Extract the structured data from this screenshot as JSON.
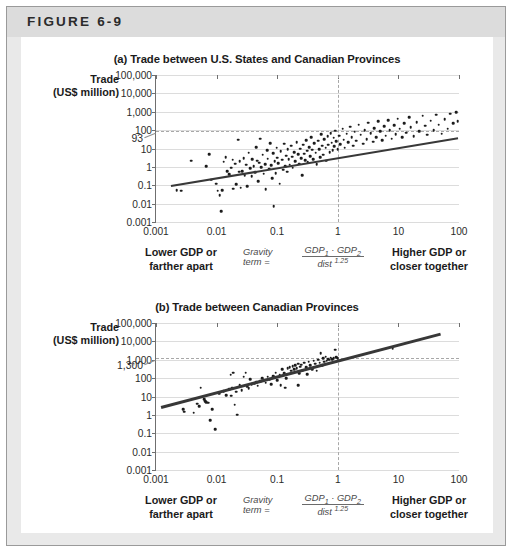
{
  "figure": {
    "label": "FIGURE 6-9"
  },
  "panels": [
    {
      "id": "a",
      "title": "(a) Trade between U.S. States and Canadian Provinces",
      "ylabel_line1": "Trade",
      "ylabel_line2": "(US$ million)",
      "annotation": "93",
      "caption_left_line1": "Lower GDP or",
      "caption_left_line2": "farther apart",
      "caption_right_line1": "Higher GDP or",
      "caption_right_line2": "closer together",
      "gravity_label": "Gravity term =",
      "gravity_num_a": "GDP",
      "gravity_num_sub_a": "1",
      "gravity_dot": "·",
      "gravity_num_b": "GDP",
      "gravity_num_sub_b": "2",
      "gravity_den": "dist",
      "gravity_den_sup": "1.25"
    },
    {
      "id": "b",
      "title": "(b) Trade between Canadian Provinces",
      "ylabel_line1": "Trade",
      "ylabel_line2": "(US$ million)",
      "annotation": "1,300",
      "caption_left_line1": "Lower GDP or",
      "caption_left_line2": "farther apart",
      "caption_right_line1": "Higher GDP or",
      "caption_right_line2": "closer together",
      "gravity_label": "Gravity term =",
      "gravity_num_a": "GDP",
      "gravity_num_sub_a": "1",
      "gravity_dot": "·",
      "gravity_num_b": "GDP",
      "gravity_num_sub_b": "2",
      "gravity_den": "dist",
      "gravity_den_sup": "1.25"
    }
  ],
  "chart_data": [
    {
      "type": "scatter",
      "panel": "a",
      "title": "(a) Trade between U.S. States and Canadian Provinces",
      "xlabel": "Gravity term = GDP1 · GDP2 / dist^1.25",
      "ylabel": "Trade (US$ million)",
      "xscale": "log",
      "yscale": "log",
      "xlim": [
        0.001,
        100
      ],
      "ylim": [
        0.001,
        100000
      ],
      "xticks": [
        "0.001",
        "0.01",
        "0.1",
        "1",
        "10",
        "100"
      ],
      "yticks": [
        "0.001",
        "0.01",
        "0.1",
        "1",
        "10",
        "100",
        "1,000",
        "10,000",
        "100,000"
      ],
      "grid": true,
      "reference_lines": {
        "horizontal_y": 93,
        "horizontal_label": "93",
        "vertical_x": 1
      },
      "trendline": {
        "x": [
          0.0018,
          100
        ],
        "y": [
          0.1,
          40
        ]
      },
      "points": [
        [
          0.0022,
          0.055
        ],
        [
          0.0026,
          0.05
        ],
        [
          0.0038,
          2.2
        ],
        [
          0.0068,
          1.1
        ],
        [
          0.0075,
          5.0
        ],
        [
          0.0082,
          0.2
        ],
        [
          0.0098,
          0.12
        ],
        [
          0.0105,
          0.05
        ],
        [
          0.0112,
          0.028
        ],
        [
          0.0118,
          0.004
        ],
        [
          0.0125,
          0.055
        ],
        [
          0.013,
          1.9
        ],
        [
          0.0142,
          3.4
        ],
        [
          0.015,
          0.6
        ],
        [
          0.0162,
          0.4
        ],
        [
          0.0175,
          0.9
        ],
        [
          0.0185,
          2.5
        ],
        [
          0.019,
          0.065
        ],
        [
          0.0205,
          1.5
        ],
        [
          0.021,
          0.11
        ],
        [
          0.0225,
          30
        ],
        [
          0.0235,
          0.55
        ],
        [
          0.024,
          2.0
        ],
        [
          0.025,
          0.075
        ],
        [
          0.0265,
          0.6
        ],
        [
          0.028,
          3.0
        ],
        [
          0.029,
          0.36
        ],
        [
          0.031,
          1.3
        ],
        [
          0.032,
          0.09
        ],
        [
          0.034,
          6.0
        ],
        [
          0.036,
          0.85
        ],
        [
          0.038,
          0.3
        ],
        [
          0.039,
          2.6
        ],
        [
          0.041,
          1.05
        ],
        [
          0.043,
          0.5
        ],
        [
          0.045,
          12
        ],
        [
          0.047,
          2.2
        ],
        [
          0.049,
          0.17
        ],
        [
          0.051,
          1.7
        ],
        [
          0.053,
          35
        ],
        [
          0.055,
          0.95
        ],
        [
          0.058,
          4.5
        ],
        [
          0.06,
          0.42
        ],
        [
          0.063,
          1.4
        ],
        [
          0.065,
          0.06
        ],
        [
          0.068,
          8.0
        ],
        [
          0.07,
          2.8
        ],
        [
          0.073,
          0.8
        ],
        [
          0.076,
          20
        ],
        [
          0.079,
          1.2
        ],
        [
          0.082,
          0.25
        ],
        [
          0.085,
          5.5
        ],
        [
          0.088,
          0.007
        ],
        [
          0.091,
          2.1
        ],
        [
          0.095,
          0.45
        ],
        [
          0.098,
          11
        ],
        [
          0.1,
          3.2
        ],
        [
          0.105,
          1.6
        ],
        [
          0.11,
          0.12
        ],
        [
          0.115,
          7.0
        ],
        [
          0.12,
          2.4
        ],
        [
          0.125,
          0.7
        ],
        [
          0.13,
          18
        ],
        [
          0.135,
          1.1
        ],
        [
          0.14,
          4.0
        ],
        [
          0.145,
          0.55
        ],
        [
          0.15,
          9.0
        ],
        [
          0.155,
          2.7
        ],
        [
          0.16,
          1.3
        ],
        [
          0.17,
          14
        ],
        [
          0.175,
          3.6
        ],
        [
          0.18,
          0.9
        ],
        [
          0.19,
          6.5
        ],
        [
          0.2,
          2.0
        ],
        [
          0.21,
          22
        ],
        [
          0.22,
          4.8
        ],
        [
          0.23,
          1.5
        ],
        [
          0.24,
          10
        ],
        [
          0.25,
          3.0
        ],
        [
          0.26,
          0.35
        ],
        [
          0.27,
          16
        ],
        [
          0.28,
          5.2
        ],
        [
          0.29,
          2.3
        ],
        [
          0.3,
          28
        ],
        [
          0.31,
          7.5
        ],
        [
          0.32,
          1.8
        ],
        [
          0.34,
          12
        ],
        [
          0.35,
          3.8
        ],
        [
          0.36,
          40
        ],
        [
          0.38,
          8.5
        ],
        [
          0.39,
          2.6
        ],
        [
          0.41,
          19
        ],
        [
          0.43,
          5.8
        ],
        [
          0.45,
          1.4
        ],
        [
          0.47,
          26
        ],
        [
          0.49,
          9.5
        ],
        [
          0.51,
          3.4
        ],
        [
          0.53,
          60
        ],
        [
          0.55,
          14
        ],
        [
          0.58,
          4.6
        ],
        [
          0.6,
          32
        ],
        [
          0.63,
          11
        ],
        [
          0.65,
          2.2
        ],
        [
          0.68,
          45
        ],
        [
          0.7,
          16
        ],
        [
          0.73,
          6.2
        ],
        [
          0.76,
          70
        ],
        [
          0.79,
          21
        ],
        [
          0.82,
          8.0
        ],
        [
          0.85,
          38
        ],
        [
          0.88,
          13
        ],
        [
          0.91,
          95
        ],
        [
          0.95,
          25
        ],
        [
          1.0,
          9.0
        ],
        [
          1.05,
          50
        ],
        [
          1.1,
          17
        ],
        [
          1.2,
          120
        ],
        [
          1.25,
          30
        ],
        [
          1.3,
          11
        ],
        [
          1.4,
          65
        ],
        [
          1.5,
          22
        ],
        [
          1.6,
          150
        ],
        [
          1.7,
          42
        ],
        [
          1.8,
          14
        ],
        [
          1.9,
          80
        ],
        [
          2.0,
          27
        ],
        [
          2.2,
          200
        ],
        [
          2.4,
          55
        ],
        [
          2.6,
          18
        ],
        [
          2.8,
          100
        ],
        [
          3.0,
          33
        ],
        [
          3.2,
          250
        ],
        [
          3.5,
          70
        ],
        [
          3.8,
          24
        ],
        [
          4.0,
          130
        ],
        [
          4.3,
          42
        ],
        [
          4.6,
          300
        ],
        [
          5.0,
          85
        ],
        [
          5.4,
          28
        ],
        [
          5.8,
          160
        ],
        [
          6.2,
          50
        ],
        [
          6.8,
          350
        ],
        [
          7.2,
          100
        ],
        [
          7.8,
          34
        ],
        [
          8.5,
          190
        ],
        [
          9.0,
          60
        ],
        [
          9.8,
          420
        ],
        [
          10.5,
          120
        ],
        [
          11.5,
          40
        ],
        [
          12.5,
          230
        ],
        [
          13.5,
          72
        ],
        [
          15,
          500
        ],
        [
          16,
          140
        ],
        [
          18,
          48
        ],
        [
          20,
          270
        ],
        [
          22,
          85
        ],
        [
          25,
          600
        ],
        [
          28,
          170
        ],
        [
          30,
          55
        ],
        [
          34,
          320
        ],
        [
          38,
          100
        ],
        [
          42,
          700
        ],
        [
          46,
          200
        ],
        [
          52,
          65
        ],
        [
          58,
          380
        ],
        [
          65,
          120
        ],
        [
          72,
          800
        ],
        [
          80,
          240
        ],
        [
          90,
          950
        ],
        [
          95,
          300
        ]
      ]
    },
    {
      "type": "scatter",
      "panel": "b",
      "title": "(b) Trade between Canadian Provinces",
      "xlabel": "Gravity term = GDP1 · GDP2 / dist^1.25",
      "ylabel": "Trade (US$ million)",
      "xscale": "log",
      "yscale": "log",
      "xlim": [
        0.001,
        100
      ],
      "ylim": [
        0.001,
        100000
      ],
      "xticks": [
        "0.001",
        "0.01",
        "0.1",
        "1",
        "10",
        "100"
      ],
      "yticks": [
        "0.001",
        "0.01",
        "0.1",
        "1",
        "10",
        "100",
        "1,000",
        "10,000",
        "100,000"
      ],
      "grid": true,
      "reference_lines": {
        "horizontal_y": 1300,
        "horizontal_label": "1,300",
        "vertical_x": 1
      },
      "trendline": {
        "x": [
          0.0012,
          50
        ],
        "y": [
          3.0,
          30000
        ]
      },
      "points": [
        [
          0.0028,
          2.0
        ],
        [
          0.0029,
          1.5
        ],
        [
          0.0042,
          1.3
        ],
        [
          0.0048,
          4.0
        ],
        [
          0.0052,
          3.0
        ],
        [
          0.0055,
          30
        ],
        [
          0.0062,
          7.0
        ],
        [
          0.0065,
          5.5
        ],
        [
          0.0068,
          5.0
        ],
        [
          0.0072,
          4.5
        ],
        [
          0.0078,
          0.5
        ],
        [
          0.0085,
          2.0
        ],
        [
          0.0095,
          0.17
        ],
        [
          0.011,
          14
        ],
        [
          0.013,
          20
        ],
        [
          0.0145,
          12
        ],
        [
          0.016,
          25
        ],
        [
          0.017,
          150
        ],
        [
          0.0175,
          11
        ],
        [
          0.018,
          30
        ],
        [
          0.019,
          200
        ],
        [
          0.02,
          3.5
        ],
        [
          0.021,
          18
        ],
        [
          0.022,
          1.0
        ],
        [
          0.024,
          40
        ],
        [
          0.026,
          22
        ],
        [
          0.028,
          120
        ],
        [
          0.03,
          200
        ],
        [
          0.032,
          35
        ],
        [
          0.034,
          28
        ],
        [
          0.036,
          90
        ],
        [
          0.038,
          45
        ],
        [
          0.042,
          50
        ],
        [
          0.045,
          60
        ],
        [
          0.048,
          38
        ],
        [
          0.052,
          70
        ],
        [
          0.056,
          100
        ],
        [
          0.06,
          80
        ],
        [
          0.065,
          55
        ],
        [
          0.07,
          120
        ],
        [
          0.075,
          90
        ],
        [
          0.08,
          45
        ],
        [
          0.085,
          130
        ],
        [
          0.09,
          110
        ],
        [
          0.095,
          200
        ],
        [
          0.1,
          75
        ],
        [
          0.11,
          150
        ],
        [
          0.115,
          40
        ],
        [
          0.12,
          300
        ],
        [
          0.13,
          180
        ],
        [
          0.14,
          100
        ],
        [
          0.15,
          350
        ],
        [
          0.16,
          400
        ],
        [
          0.17,
          250
        ],
        [
          0.18,
          450
        ],
        [
          0.19,
          300
        ],
        [
          0.2,
          500
        ],
        [
          0.21,
          350
        ],
        [
          0.22,
          600
        ],
        [
          0.23,
          180
        ],
        [
          0.24,
          420
        ],
        [
          0.25,
          550
        ],
        [
          0.26,
          250
        ],
        [
          0.28,
          700
        ],
        [
          0.3,
          400
        ],
        [
          0.31,
          160
        ],
        [
          0.33,
          800
        ],
        [
          0.35,
          500
        ],
        [
          0.38,
          300
        ],
        [
          0.4,
          900
        ],
        [
          0.42,
          600
        ],
        [
          0.45,
          250
        ],
        [
          0.48,
          1000
        ],
        [
          0.5,
          700
        ],
        [
          0.52,
          2200
        ],
        [
          0.55,
          500
        ],
        [
          0.58,
          1200
        ],
        [
          0.6,
          800
        ],
        [
          0.63,
          1500
        ],
        [
          0.66,
          900
        ],
        [
          0.7,
          1100
        ],
        [
          0.73,
          1000
        ],
        [
          0.76,
          1300
        ],
        [
          0.8,
          1100
        ],
        [
          0.85,
          1200
        ],
        [
          0.9,
          3500
        ],
        [
          0.95,
          1400
        ],
        [
          1.0,
          1200
        ],
        [
          0.135,
          30
        ],
        [
          0.22,
          40
        ],
        [
          8.0,
          4000
        ]
      ]
    }
  ]
}
